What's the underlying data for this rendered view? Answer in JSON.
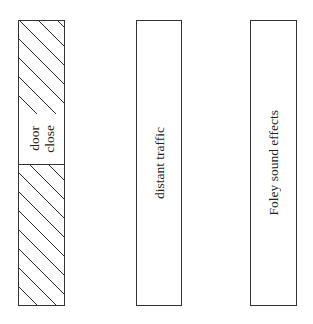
{
  "diagram": {
    "type": "audio-track-layers",
    "tracks": [
      {
        "id": "track-1",
        "fill": "hatched",
        "events": [
          {
            "label_lines": [
              "door",
              "close"
            ]
          }
        ]
      },
      {
        "id": "track-2",
        "fill": "empty",
        "label": "distant traffic"
      },
      {
        "id": "track-3",
        "fill": "empty",
        "label": "Foley sound effects"
      }
    ],
    "colors": {
      "stroke": "#333333",
      "background": "#ffffff",
      "text": "#222222"
    }
  }
}
